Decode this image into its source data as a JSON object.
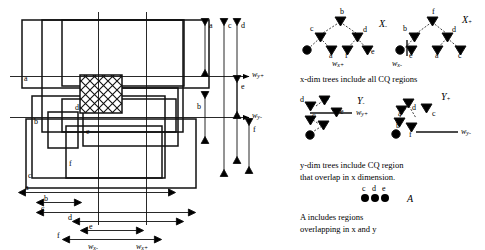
{
  "figure": {
    "regions": [
      "a",
      "b",
      "c",
      "d",
      "e",
      "f"
    ],
    "query_region_label": "CQ",
    "axes": {
      "wy_plus": "w",
      "wy_plus_sub": "y+",
      "wy_minus": "w",
      "wy_minus_sub": "y-",
      "wx_minus": "w",
      "wx_minus_sub": "x-",
      "wx_plus": "w",
      "wx_plus_sub": "x+"
    }
  },
  "left_panel": {
    "rect_labels": [
      {
        "id": "a",
        "label": "a"
      },
      {
        "id": "b",
        "label": "b"
      },
      {
        "id": "c",
        "label": "c"
      },
      {
        "id": "d",
        "label": "d"
      },
      {
        "id": "e",
        "label": "e"
      },
      {
        "id": "f",
        "label": "f"
      }
    ],
    "vertical_intervals": [
      {
        "label": "a"
      },
      {
        "label": "b"
      },
      {
        "label": "c"
      },
      {
        "label": "d"
      },
      {
        "label": "e"
      },
      {
        "label": "f"
      }
    ],
    "horizontal_intervals": [
      {
        "label": "a"
      },
      {
        "label": "b"
      },
      {
        "label": "c"
      },
      {
        "label": "d"
      },
      {
        "label": "e"
      },
      {
        "label": "f"
      }
    ]
  },
  "right_panel": {
    "trees": [
      {
        "name": "X_minus",
        "title": "X",
        "title_sub": "-",
        "axis_label": "w",
        "axis_sub": "x+",
        "nodes": [
          "b",
          "c",
          "d",
          "a",
          "f",
          "e"
        ]
      },
      {
        "name": "X_plus",
        "title": "X",
        "title_sub": "+",
        "axis_label": "w",
        "axis_sub": "x-",
        "nodes": [
          "f",
          "b",
          "d",
          "e",
          "a",
          "c"
        ]
      },
      {
        "name": "Y_minus",
        "title": "Y",
        "title_sub": "-",
        "axis_label": "w",
        "axis_sub": "y+",
        "nodes": [
          "d",
          "a",
          "c",
          "e"
        ]
      },
      {
        "name": "Y_plus",
        "title": "Y",
        "title_sub": "+",
        "axis_label": "w",
        "axis_sub": "y-",
        "nodes": [
          "a",
          "d",
          "c",
          "b",
          "f"
        ]
      }
    ],
    "caption_x": "x-dim trees include all CQ regions",
    "caption_y_line1": "y-dim trees include CQ region",
    "caption_y_line2": "that overlap in x dimension.",
    "result_set": {
      "label": "A",
      "items": [
        "c",
        "d",
        "e"
      ],
      "caption_line1": "A includes regions",
      "caption_line2": "overlapping in x and y"
    }
  }
}
